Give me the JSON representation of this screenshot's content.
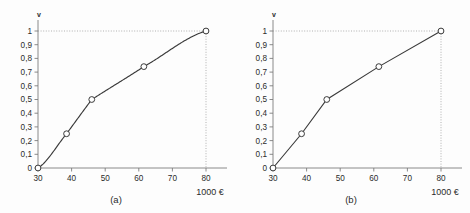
{
  "figure": {
    "background_color": "#fdfdfd",
    "axis_color": "#8a8a8a",
    "curve_color": "#3a3a3a",
    "guide_color": "#a8a8a8"
  },
  "panels": [
    {
      "id": "a",
      "caption": "(a)",
      "y_axis_name": "v",
      "x_unit_label": "1000 €"
    },
    {
      "id": "b",
      "caption": "(b)",
      "y_axis_name": "v",
      "x_unit_label": "1000 €"
    }
  ],
  "chart_data": [
    {
      "type": "line",
      "title": "(a)",
      "subtitle": "",
      "xlabel": "1000 €",
      "ylabel": "v",
      "xlim": [
        30,
        80
      ],
      "ylim": [
        0,
        1
      ],
      "grid": false,
      "legend": "none",
      "xticklabels": [
        "30",
        "40",
        "50",
        "60",
        "70",
        "80"
      ],
      "xticks": [
        30,
        40,
        50,
        60,
        70,
        80
      ],
      "yticklabels": [
        "0",
        "0,1",
        "0,2",
        "0,3",
        "0,4",
        "0,5",
        "0,6",
        "0,7",
        "0,8",
        "0,9",
        "1"
      ],
      "yticks": [
        0,
        0.1,
        0.2,
        0.3,
        0.4,
        0.5,
        0.6,
        0.7,
        0.8,
        0.9,
        1
      ],
      "interpolation": "smooth-concave-fit",
      "x": [
        30,
        38.5,
        46,
        61.5,
        80
      ],
      "values": [
        0,
        0.25,
        0.5,
        0.74,
        1
      ],
      "annotations": [
        {
          "text": "horizontal dotted guide at v = 1",
          "y": 1
        },
        {
          "text": "vertical dotted guide at 1000 € = 80",
          "x": 80
        }
      ]
    },
    {
      "type": "line",
      "title": "(b)",
      "subtitle": "",
      "xlabel": "1000 €",
      "ylabel": "v",
      "xlim": [
        30,
        80
      ],
      "ylim": [
        0,
        1
      ],
      "grid": false,
      "legend": "none",
      "xticklabels": [
        "30",
        "40",
        "50",
        "60",
        "70",
        "80"
      ],
      "xticks": [
        30,
        40,
        50,
        60,
        70,
        80
      ],
      "yticklabels": [
        "0",
        "0,1",
        "0,2",
        "0,3",
        "0,4",
        "0,5",
        "0,6",
        "0,7",
        "0,8",
        "0,9",
        "1"
      ],
      "yticks": [
        0,
        0.1,
        0.2,
        0.3,
        0.4,
        0.5,
        0.6,
        0.7,
        0.8,
        0.9,
        1
      ],
      "interpolation": "piecewise-linear",
      "x": [
        30,
        38.5,
        46,
        61.5,
        80
      ],
      "values": [
        0,
        0.25,
        0.5,
        0.74,
        1
      ],
      "annotations": [
        {
          "text": "horizontal dotted guide at v = 1",
          "y": 1
        },
        {
          "text": "vertical dotted guide at 1000 € = 80",
          "x": 80
        }
      ]
    }
  ]
}
